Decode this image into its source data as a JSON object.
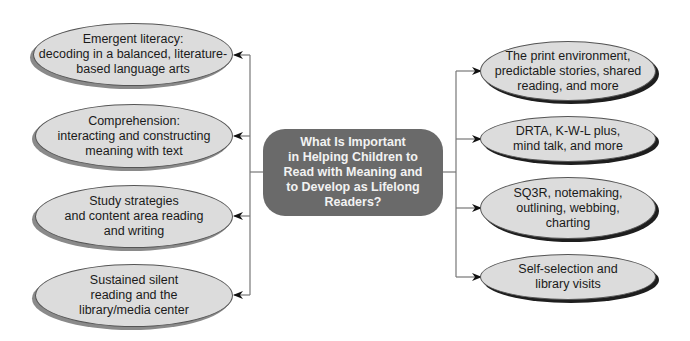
{
  "center": {
    "label": "What Is Important\nin Helping Children to\nRead with Meaning and\nto Develop as Lifelong\nReaders?",
    "fill": "#6a6a6a"
  },
  "left_nodes": [
    {
      "label": "Emergent literacy:\ndecoding in a balanced, literature-\nbased language arts"
    },
    {
      "label": "Comprehension:\ninteracting and constructing\nmeaning with text"
    },
    {
      "label": "Study strategies\nand content area reading\nand writing"
    },
    {
      "label": "Sustained silent\nreading and the\nlibrary/media center"
    }
  ],
  "right_nodes": [
    {
      "label": "The print environment,\npredictable stories, shared\nreading, and more"
    },
    {
      "label": "DRTA, K-W-L plus,\nmind talk, and more"
    },
    {
      "label": "SQ3R, notemaking,\noutlining, webbing,\ncharting"
    },
    {
      "label": "Self-selection and\nlibrary visits"
    }
  ],
  "colors": {
    "node_fill": "#dcdcdc",
    "connector": "#777777",
    "arrowhead": "#111111"
  }
}
